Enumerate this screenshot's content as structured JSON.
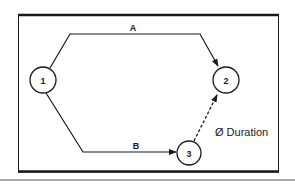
{
  "diagram": {
    "type": "activity-network",
    "colors": {
      "line": "#1a1a1a",
      "background": "#ffffff"
    },
    "nodes": [
      {
        "id": "1",
        "label": "1"
      },
      {
        "id": "2",
        "label": "2"
      },
      {
        "id": "3",
        "label": "3"
      }
    ],
    "edges": [
      {
        "id": "A",
        "from": "1",
        "to": "2",
        "label": "A",
        "style": "solid"
      },
      {
        "id": "B",
        "from": "1",
        "to": "3",
        "label": "B",
        "style": "solid"
      },
      {
        "id": "dummy",
        "from": "3",
        "to": "2",
        "label": "",
        "style": "dashed"
      }
    ],
    "annotation": "Ø Duration"
  }
}
